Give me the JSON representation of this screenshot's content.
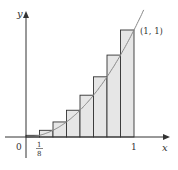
{
  "figure": {
    "function": "y = x^2",
    "n_rectangles": 8,
    "rectangle_rule": "right-endpoint (upper sum)",
    "colors": {
      "axis": "#333333",
      "curve": "#888888",
      "rect_fill": "#e6e6e6",
      "rect_stroke": "#333333"
    }
  },
  "labels": {
    "y_axis": "y",
    "x_axis": "x",
    "origin": "0",
    "one": "1",
    "point": "(1, 1)",
    "frac_num": "1",
    "frac_den": "8"
  },
  "chart_data": {
    "type": "area",
    "title": "",
    "xlabel": "x",
    "ylabel": "y",
    "xlim": [
      0,
      1
    ],
    "ylim": [
      0,
      1
    ],
    "x": [
      0.125,
      0.25,
      0.375,
      0.5,
      0.625,
      0.75,
      0.875,
      1.0
    ],
    "values": [
      0.015625,
      0.0625,
      0.140625,
      0.25,
      0.390625,
      0.5625,
      0.765625,
      1.0
    ],
    "annotations": [
      "(1, 1)",
      "1/8",
      "0",
      "1"
    ]
  }
}
